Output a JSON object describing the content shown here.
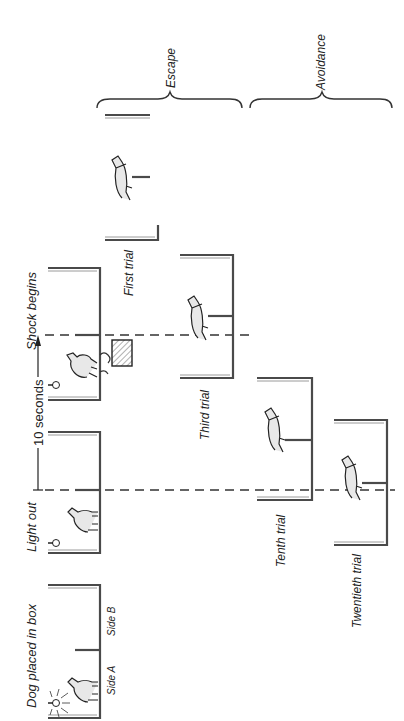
{
  "diagram": {
    "sequence_labels": {
      "dog_placed": "Dog placed in box",
      "light_out": "Light out",
      "ten_seconds": "10 seconds",
      "shock_begins": "Shock begins"
    },
    "side_labels": {
      "side_a": "Side A",
      "side_b": "Side B"
    },
    "trials": [
      {
        "label": "First trial"
      },
      {
        "label": "Third trial"
      },
      {
        "label": "Tenth trial"
      },
      {
        "label": "Twentieth trial"
      }
    ],
    "groups": {
      "escape": "Escape",
      "avoidance": "Avoidance"
    },
    "colors": {
      "line": "#4a4a4a",
      "text": "#222222",
      "background": "#ffffff"
    }
  }
}
